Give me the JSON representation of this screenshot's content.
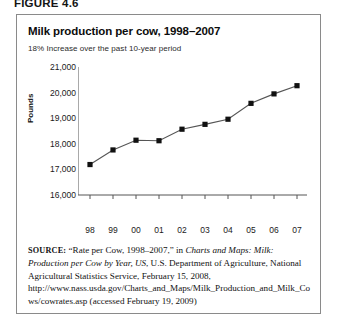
{
  "figure_label": "FIGURE 4.6",
  "chart_title": "Milk production per cow, 1998–2007",
  "chart_subtitle": "18% Increase over the past 10-year period",
  "source": {
    "label": "SOURCE:",
    "part1": " “Rate per Cow, 1998–2007,” in ",
    "italic1": "Charts and Maps: Milk: Production per Cow by Year, US",
    "part2": ", U.S. Department of Agriculture, National Agricultural Statistics Service, February 15, 2008, http://www.nass.usda.gov/Charts_and_Maps/Milk_Production_and_Milk_Cows/cowrates.asp (accessed February 19, 2009)"
  },
  "chart_data": {
    "type": "line",
    "title": "Milk production per cow, 1998–2007",
    "subtitle": "18% Increase over the past 10-year period",
    "xlabel": "",
    "ylabel": "Pounds",
    "ylim": [
      16000,
      21000
    ],
    "ytick_labels": [
      "21,000",
      "20,000",
      "19,000",
      "18,000",
      "17,000",
      "16,000"
    ],
    "ytick_values": [
      21000,
      20000,
      19000,
      18000,
      17000,
      16000
    ],
    "categories": [
      "98",
      "99",
      "00",
      "01",
      "02",
      "03",
      "04",
      "05",
      "06",
      "07"
    ],
    "values": [
      17190,
      17760,
      18140,
      18120,
      18570,
      18760,
      18960,
      19580,
      19950,
      20270
    ],
    "grid": false,
    "legend": false,
    "marker": "square",
    "line_color": "#555555",
    "marker_color": "#111111"
  }
}
